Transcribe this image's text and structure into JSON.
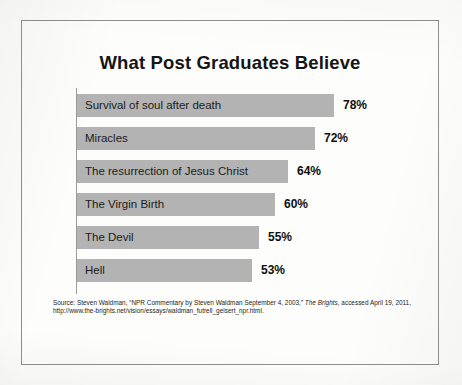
{
  "slide": {
    "title": "What Post Graduates Believe"
  },
  "chart_data": {
    "type": "bar",
    "title": "What Post Graduates Believe",
    "xlabel": "",
    "ylabel": "",
    "orientation": "horizontal",
    "grid": false,
    "legend": false,
    "xlim": [
      0,
      100
    ],
    "value_suffix": "%",
    "bar_color": "#b3b3b3",
    "categories": [
      "Survival of soul after death",
      "Miracles",
      "The resurrection of Jesus Christ",
      "The Virgin Birth",
      "The Devil",
      "Hell"
    ],
    "values": [
      78,
      72,
      64,
      60,
      55,
      53
    ],
    "value_labels": [
      "78%",
      "72%",
      "64%",
      "60%",
      "55%",
      "53%"
    ]
  },
  "source": {
    "part1": "Source: Steven Waldman, “NPR Commentary by Steven Waldman September 4, 2003,” ",
    "italic1": "The Brights",
    "part2": ", accessed April 19, 2011, http://www.the-brights.net/vision/essays/waldman_futrell_geisert_npr.html."
  }
}
